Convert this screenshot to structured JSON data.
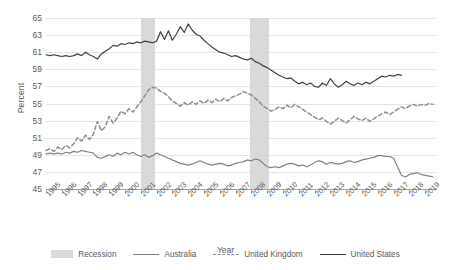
{
  "chart_data": {
    "type": "line",
    "title": "",
    "xlabel": "Year",
    "ylabel": "Percent",
    "xlim": [
      1995,
      2019.75
    ],
    "ylim": [
      45,
      65
    ],
    "ytick_step": 2,
    "grid": true,
    "legend_position": "bottom",
    "categories": [
      "1995",
      "1996",
      "1997",
      "1998",
      "1999",
      "2000",
      "2001",
      "2002",
      "2003",
      "2004",
      "2005",
      "2006",
      "2007",
      "2008",
      "2009",
      "2010",
      "2011",
      "2012",
      "2013",
      "2014",
      "2015",
      "2016",
      "2017",
      "2018",
      "2019"
    ],
    "yticks": [
      45,
      47,
      49,
      51,
      53,
      55,
      57,
      59,
      61,
      63,
      65
    ],
    "annotations": [
      {
        "label": "Recession",
        "type": "band",
        "x_start": 2001.0,
        "x_end": 2001.9
      },
      {
        "label": "Recession",
        "type": "band",
        "x_start": 2007.9,
        "x_end": 2009.1
      }
    ],
    "series": [
      {
        "name": "Australia",
        "style": "solid",
        "color": "#808080",
        "x": [
          1995.0,
          1995.25,
          1995.5,
          1995.75,
          1996.0,
          1996.25,
          1996.5,
          1996.75,
          1997.0,
          1997.25,
          1997.5,
          1997.75,
          1998.0,
          1998.25,
          1998.5,
          1998.75,
          1999.0,
          1999.25,
          1999.5,
          1999.75,
          2000.0,
          2000.25,
          2000.5,
          2000.75,
          2001.0,
          2001.25,
          2001.5,
          2001.75,
          2002.0,
          2002.25,
          2002.5,
          2002.75,
          2003.0,
          2003.25,
          2003.5,
          2003.75,
          2004.0,
          2004.25,
          2004.5,
          2004.75,
          2005.0,
          2005.25,
          2005.5,
          2005.75,
          2006.0,
          2006.25,
          2006.5,
          2006.75,
          2007.0,
          2007.25,
          2007.5,
          2007.75,
          2008.0,
          2008.25,
          2008.5,
          2008.75,
          2009.0,
          2009.25,
          2009.5,
          2009.75,
          2010.0,
          2010.25,
          2010.5,
          2010.75,
          2011.0,
          2011.25,
          2011.5,
          2011.75,
          2012.0,
          2012.25,
          2012.5,
          2012.75,
          2013.0,
          2013.25,
          2013.5,
          2013.75,
          2014.0,
          2014.25,
          2014.5,
          2014.75,
          2015.0,
          2015.25,
          2015.5,
          2015.75,
          2016.0,
          2016.25,
          2016.5,
          2016.75,
          2017.0,
          2017.25,
          2017.5,
          2017.75,
          2018.0,
          2018.25,
          2018.5,
          2018.75,
          2019.0,
          2019.25,
          2019.5
        ],
        "values": [
          49.1,
          49.2,
          49.1,
          49.2,
          49.1,
          49.3,
          49.2,
          49.4,
          49.3,
          49.5,
          49.4,
          49.3,
          49.2,
          48.7,
          48.6,
          48.8,
          49.0,
          48.8,
          49.2,
          49.0,
          49.3,
          49.1,
          49.3,
          49.0,
          48.8,
          49.0,
          48.7,
          48.9,
          49.2,
          49.0,
          48.8,
          48.6,
          48.4,
          48.2,
          48.0,
          47.9,
          47.8,
          47.9,
          48.1,
          48.3,
          48.1,
          47.9,
          47.8,
          47.9,
          48.0,
          47.9,
          47.7,
          47.8,
          48.0,
          48.1,
          48.2,
          48.4,
          48.3,
          48.5,
          48.4,
          48.0,
          47.6,
          47.5,
          47.6,
          47.5,
          47.7,
          47.9,
          48.0,
          47.9,
          47.7,
          47.8,
          47.6,
          47.8,
          48.1,
          48.3,
          48.2,
          47.9,
          48.1,
          48.0,
          47.9,
          48.0,
          48.2,
          48.3,
          48.1,
          48.2,
          48.4,
          48.5,
          48.6,
          48.7,
          48.9,
          48.9,
          48.8,
          48.8,
          48.6,
          47.6,
          46.6,
          46.4,
          46.7,
          46.8,
          46.9,
          46.7,
          46.6,
          46.5,
          46.4
        ]
      },
      {
        "name": "United Kingdom",
        "style": "dashed",
        "color": "#8c8c8c",
        "x": [
          1995.0,
          1995.25,
          1995.5,
          1995.75,
          1996.0,
          1996.25,
          1996.5,
          1996.75,
          1997.0,
          1997.25,
          1997.5,
          1997.75,
          1998.0,
          1998.25,
          1998.5,
          1998.75,
          1999.0,
          1999.25,
          1999.5,
          1999.75,
          2000.0,
          2000.25,
          2000.5,
          2000.75,
          2001.0,
          2001.25,
          2001.5,
          2001.75,
          2002.0,
          2002.25,
          2002.5,
          2002.75,
          2003.0,
          2003.25,
          2003.5,
          2003.75,
          2004.0,
          2004.25,
          2004.5,
          2004.75,
          2005.0,
          2005.25,
          2005.5,
          2005.75,
          2006.0,
          2006.25,
          2006.5,
          2006.75,
          2007.0,
          2007.25,
          2007.5,
          2007.75,
          2008.0,
          2008.25,
          2008.5,
          2008.75,
          2009.0,
          2009.25,
          2009.5,
          2009.75,
          2010.0,
          2010.25,
          2010.5,
          2010.75,
          2011.0,
          2011.25,
          2011.5,
          2011.75,
          2012.0,
          2012.25,
          2012.5,
          2012.75,
          2013.0,
          2013.25,
          2013.5,
          2013.75,
          2014.0,
          2014.25,
          2014.5,
          2014.75,
          2015.0,
          2015.25,
          2015.5,
          2015.75,
          2016.0,
          2016.25,
          2016.5,
          2016.75,
          2017.0,
          2017.25,
          2017.5,
          2017.75,
          2018.0,
          2018.25,
          2018.5,
          2018.75,
          2019.0,
          2019.25,
          2019.5
        ],
        "values": [
          49.5,
          49.7,
          49.4,
          49.9,
          49.6,
          50.1,
          49.8,
          50.3,
          51.0,
          50.6,
          51.3,
          50.8,
          51.4,
          52.9,
          51.8,
          52.3,
          53.5,
          52.7,
          53.3,
          54.1,
          53.8,
          54.4,
          54.0,
          54.6,
          55.2,
          55.9,
          56.6,
          56.9,
          56.8,
          56.4,
          56.2,
          55.8,
          55.3,
          55.0,
          54.7,
          55.1,
          54.8,
          55.2,
          54.9,
          55.3,
          55.0,
          55.4,
          55.1,
          55.5,
          55.2,
          55.6,
          55.3,
          55.7,
          55.9,
          56.1,
          56.4,
          56.2,
          56.0,
          55.6,
          55.2,
          54.7,
          54.4,
          54.1,
          54.3,
          54.6,
          54.4,
          54.8,
          54.5,
          54.9,
          54.6,
          54.3,
          54.0,
          53.7,
          53.4,
          53.1,
          53.3,
          52.9,
          52.6,
          52.9,
          53.3,
          53.0,
          52.7,
          53.1,
          53.5,
          53.2,
          53.0,
          53.3,
          52.9,
          53.2,
          53.5,
          53.8,
          54.0,
          53.7,
          54.0,
          54.3,
          54.6,
          54.4,
          54.7,
          54.9,
          54.7,
          54.9,
          54.8,
          55.0,
          54.9
        ]
      },
      {
        "name": "United States",
        "style": "solid",
        "color": "#404040",
        "x": [
          1995.0,
          1995.25,
          1995.5,
          1995.75,
          1996.0,
          1996.25,
          1996.5,
          1996.75,
          1997.0,
          1997.25,
          1997.5,
          1997.75,
          1998.0,
          1998.25,
          1998.5,
          1998.75,
          1999.0,
          1999.25,
          1999.5,
          1999.75,
          2000.0,
          2000.25,
          2000.5,
          2000.75,
          2001.0,
          2001.25,
          2001.5,
          2001.75,
          2002.0,
          2002.25,
          2002.5,
          2002.75,
          2003.0,
          2003.25,
          2003.5,
          2003.75,
          2004.0,
          2004.25,
          2004.5,
          2004.75,
          2005.0,
          2005.25,
          2005.5,
          2005.75,
          2006.0,
          2006.25,
          2006.5,
          2006.75,
          2007.0,
          2007.25,
          2007.5,
          2007.75,
          2008.0,
          2008.25,
          2008.5,
          2008.75,
          2009.0,
          2009.25,
          2009.5,
          2009.75,
          2010.0,
          2010.25,
          2010.5,
          2010.75,
          2011.0,
          2011.25,
          2011.5,
          2011.75,
          2012.0,
          2012.25,
          2012.5,
          2012.75,
          2013.0,
          2013.25,
          2013.5,
          2013.75,
          2014.0,
          2014.25,
          2014.5,
          2014.75,
          2015.0,
          2015.25,
          2015.5,
          2015.75,
          2016.0,
          2016.25,
          2016.5,
          2016.75,
          2017.0,
          2017.25,
          2017.5
        ],
        "values": [
          60.7,
          60.6,
          60.7,
          60.6,
          60.5,
          60.6,
          60.5,
          60.6,
          60.8,
          60.6,
          61.0,
          60.7,
          60.5,
          60.2,
          60.8,
          61.1,
          61.4,
          61.8,
          61.7,
          62.0,
          61.9,
          62.1,
          62.0,
          62.2,
          62.1,
          62.3,
          62.2,
          62.1,
          62.3,
          63.4,
          62.5,
          63.5,
          62.4,
          63.1,
          64.0,
          63.3,
          64.3,
          63.6,
          63.1,
          62.9,
          62.4,
          62.0,
          61.6,
          61.3,
          61.0,
          60.9,
          60.7,
          60.5,
          60.6,
          60.4,
          60.2,
          60.1,
          60.3,
          59.9,
          59.7,
          59.4,
          59.2,
          58.9,
          58.6,
          58.3,
          58.1,
          57.9,
          58.0,
          57.6,
          57.3,
          57.5,
          57.2,
          57.4,
          57.0,
          56.9,
          57.4,
          57.1,
          57.9,
          57.3,
          56.9,
          57.2,
          57.6,
          57.3,
          57.1,
          57.4,
          57.2,
          57.5,
          57.3,
          57.6,
          57.9,
          58.2,
          58.1,
          58.3,
          58.2,
          58.4,
          58.3
        ]
      }
    ]
  },
  "legend": {
    "items": [
      {
        "label": "Recession",
        "swatch": "band"
      },
      {
        "label": "Australia",
        "swatch": "solid-gray"
      },
      {
        "label": "United Kingdom",
        "swatch": "dashed-gray"
      },
      {
        "label": "United States",
        "swatch": "solid-dark"
      }
    ]
  },
  "colors": {
    "recession_band": "#d9d9d9",
    "australia": "#808080",
    "united_kingdom": "#8c8c8c",
    "united_states": "#404040",
    "gridline": "#e4e4e4",
    "axis": "#a6a6a6",
    "text": "#5a5a5a"
  }
}
